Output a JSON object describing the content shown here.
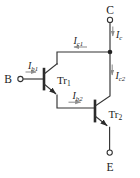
{
  "diagram": {
    "kind": "darlington-pair-transistor-circuit",
    "colors": {
      "background": "#ffffff",
      "wire": "#333333",
      "text": "#1c1c1c",
      "current_arrow": "#8f8f8f"
    },
    "terminals": {
      "b": {
        "label": "B"
      },
      "c": {
        "label": "C"
      },
      "e": {
        "label": "E"
      }
    },
    "transistors": {
      "tr1": {
        "main": "Tr",
        "sub": "1"
      },
      "tr2": {
        "main": "Tr",
        "sub": "2"
      }
    },
    "currents": {
      "ib1": {
        "main": "I",
        "sub": "b1",
        "direction": "right"
      },
      "ic1": {
        "main": "I",
        "sub": "c1",
        "direction": "left"
      },
      "ic": {
        "main": "I",
        "sub": "c",
        "direction": "down"
      },
      "ic2": {
        "main": "I",
        "sub": "c2",
        "direction": "down"
      },
      "ib2": {
        "main": "I",
        "sub": "b2",
        "direction": "right"
      }
    }
  }
}
